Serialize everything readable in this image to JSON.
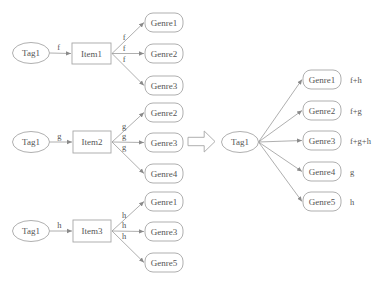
{
  "diagram": {
    "colors": {
      "stroke": "#a6a6a6",
      "edge": "#9a9a9a",
      "text": "#555555",
      "background": "#ffffff"
    },
    "left_groups": [
      {
        "tag": {
          "label": "Tag1",
          "cx": 31,
          "cy": 53
        },
        "tag_edge_label": "f",
        "item": {
          "label": "Item1",
          "x": 72,
          "y": 43,
          "w": 39,
          "h": 21
        },
        "genres": [
          {
            "label": "Genre1",
            "edge_label": "f",
            "x": 145,
            "y": 13
          },
          {
            "label": "Genre2",
            "edge_label": "f",
            "x": 145,
            "y": 44
          },
          {
            "label": "Genre3",
            "edge_label": "f",
            "x": 145,
            "y": 76
          }
        ]
      },
      {
        "tag": {
          "label": "Tag1",
          "cx": 31,
          "cy": 142
        },
        "tag_edge_label": "g",
        "item": {
          "label": "Item2",
          "x": 73,
          "y": 131,
          "w": 38,
          "h": 22
        },
        "genres": [
          {
            "label": "Genre2",
            "edge_label": "g",
            "x": 145,
            "y": 103
          },
          {
            "label": "Genre3",
            "edge_label": "g",
            "x": 145,
            "y": 133
          },
          {
            "label": "Genre4",
            "edge_label": "g",
            "x": 145,
            "y": 164
          }
        ]
      },
      {
        "tag": {
          "label": "Tag1",
          "cx": 31,
          "cy": 231
        },
        "tag_edge_label": "h",
        "item": {
          "label": "Item3",
          "x": 73,
          "y": 220,
          "w": 38,
          "h": 22
        },
        "genres": [
          {
            "label": "Genre1",
            "edge_label": "h",
            "x": 145,
            "y": 192
          },
          {
            "label": "Genre3",
            "edge_label": "h",
            "x": 145,
            "y": 222
          },
          {
            "label": "Genre5",
            "edge_label": "h",
            "x": 145,
            "y": 253
          }
        ]
      }
    ],
    "transform_arrow": {
      "x": 188,
      "y": 131,
      "w": 27,
      "h": 21
    },
    "right_graph": {
      "tag": {
        "label": "Tag1",
        "cx": 240,
        "cy": 142
      },
      "genres": [
        {
          "label": "Genre1",
          "weight_label": "f+h",
          "x": 303,
          "y": 70
        },
        {
          "label": "Genre2",
          "weight_label": "f+g",
          "x": 303,
          "y": 101
        },
        {
          "label": "Genre3",
          "weight_label": "f+g+h",
          "x": 303,
          "y": 131
        },
        {
          "label": "Genre4",
          "weight_label": "g",
          "x": 303,
          "y": 162
        },
        {
          "label": "Genre5",
          "weight_label": "h",
          "x": 303,
          "y": 192
        }
      ]
    },
    "genre_box": {
      "w": 38,
      "h": 19,
      "rx": 8
    },
    "tag_ellipse": {
      "rx": 18.5,
      "ry": 10.5
    }
  }
}
